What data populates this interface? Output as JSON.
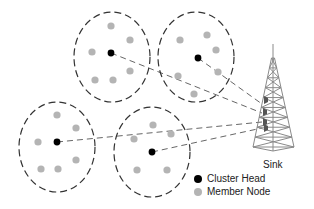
{
  "diagram": {
    "colors": {
      "cluster_head": "#000000",
      "member_node": "#b4b4b4",
      "boundary": "#333333",
      "link": "#555555",
      "tower": "#8a8a8a"
    },
    "clusters": [
      {
        "name": "cluster-top-left",
        "boundary": {
          "cx": 112,
          "cy": 57,
          "rx": 38,
          "ry": 45
        },
        "head": {
          "x": 111,
          "y": 53
        },
        "members": [
          {
            "x": 111,
            "y": 26
          },
          {
            "x": 130,
            "y": 40
          },
          {
            "x": 92,
            "y": 52
          },
          {
            "x": 130,
            "y": 71
          },
          {
            "x": 95,
            "y": 80
          },
          {
            "x": 113,
            "y": 80
          }
        ],
        "link_end": {
          "x": 262,
          "y": 113
        }
      },
      {
        "name": "cluster-top-right",
        "boundary": {
          "cx": 196,
          "cy": 57,
          "rx": 38,
          "ry": 45
        },
        "head": {
          "x": 198,
          "y": 58
        },
        "members": [
          {
            "x": 180,
            "y": 40
          },
          {
            "x": 207,
            "y": 35
          },
          {
            "x": 216,
            "y": 50
          },
          {
            "x": 218,
            "y": 72
          },
          {
            "x": 178,
            "y": 76
          },
          {
            "x": 194,
            "y": 94
          }
        ],
        "link_end": {
          "x": 262,
          "y": 104
        }
      },
      {
        "name": "cluster-bottom-left",
        "boundary": {
          "cx": 57,
          "cy": 147,
          "rx": 38,
          "ry": 45
        },
        "head": {
          "x": 57,
          "y": 142
        },
        "members": [
          {
            "x": 57,
            "y": 115
          },
          {
            "x": 76,
            "y": 128
          },
          {
            "x": 38,
            "y": 142
          },
          {
            "x": 76,
            "y": 160
          },
          {
            "x": 41,
            "y": 169
          },
          {
            "x": 58,
            "y": 169
          }
        ],
        "link_end": {
          "x": 262,
          "y": 122
        }
      },
      {
        "name": "cluster-bottom-middle",
        "boundary": {
          "cx": 152,
          "cy": 152,
          "rx": 38,
          "ry": 45
        },
        "head": {
          "x": 152,
          "y": 152
        },
        "members": [
          {
            "x": 153,
            "y": 125
          },
          {
            "x": 134,
            "y": 139
          },
          {
            "x": 171,
            "y": 134
          },
          {
            "x": 137,
            "y": 170
          },
          {
            "x": 167,
            "y": 170
          }
        ],
        "link_end": {
          "x": 262,
          "y": 128
        }
      }
    ],
    "sink": {
      "label": "Sink",
      "apex": {
        "x": 273,
        "y": 52
      },
      "base_left": {
        "x": 253,
        "y": 147
      },
      "base_right": {
        "x": 294,
        "y": 147
      }
    },
    "legend": {
      "items": [
        {
          "label": "Cluster Head",
          "type": "cluster_head"
        },
        {
          "label": "Member Node",
          "type": "member_node"
        }
      ]
    }
  }
}
